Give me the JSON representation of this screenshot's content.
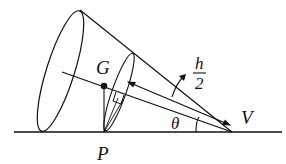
{
  "diagram": {
    "type": "geometry-figure",
    "labels": {
      "centre_of_mass": "G",
      "contact_point": "P",
      "vertex": "V",
      "angle": "θ",
      "distance_numerator": "h",
      "distance_denominator": "2"
    },
    "colors": {
      "stroke": "#111111",
      "background": "#ffffff"
    }
  }
}
